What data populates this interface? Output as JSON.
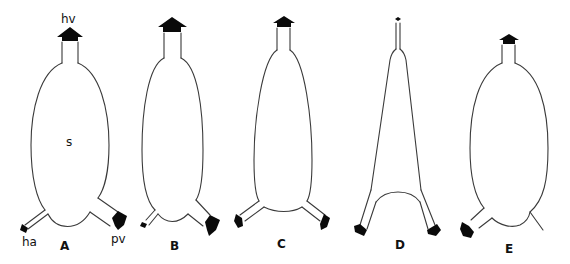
{
  "figure": {
    "type": "anatomical schematic diagram",
    "panels": [
      {
        "id": "A",
        "label": "A",
        "shape": "ovoid sac",
        "annotations": {
          "top": "hv",
          "center": "s",
          "bottom_left": "ha",
          "bottom_right": "pv"
        },
        "inlets": [
          "ha (small arrow, lower left)",
          "pv (large arrow, lower right)"
        ],
        "outlet": "hv (large arrow, top)"
      },
      {
        "id": "B",
        "label": "B",
        "shape": "elongated ovoid sac",
        "inlets": [
          "small arrow, lower left",
          "large arrow, lower right"
        ],
        "outlet": "large arrow, top"
      },
      {
        "id": "C",
        "label": "C",
        "shape": "narrow tapered sac",
        "inlets": [
          "medium arrow, lower left",
          "medium arrow, lower right"
        ],
        "outlet": "medium arrow, top"
      },
      {
        "id": "D",
        "label": "D",
        "shape": "triangular/tapered sac",
        "inlets": [
          "large arrow, lower left",
          "large arrow, lower right"
        ],
        "outlet": "very small arrow, top"
      },
      {
        "id": "E",
        "label": "E",
        "shape": "ovoid sac",
        "inlets": [
          "large arrow, lower left",
          "closed branch (no arrow), lower right"
        ],
        "outlet": "medium arrow, top"
      }
    ]
  },
  "labels": {
    "A": "A",
    "B": "B",
    "C": "C",
    "D": "D",
    "E": "E",
    "hv": "hv",
    "s": "s",
    "ha": "ha",
    "pv": "pv"
  },
  "colors": {
    "background": "#ffffff",
    "outline": "#3a3a3a",
    "arrow": "#0a0a0a",
    "text": "#111111"
  }
}
